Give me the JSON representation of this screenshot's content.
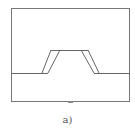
{
  "figure": {
    "caption": "a)",
    "stroke_color": "#666666",
    "background": "#ffffff"
  }
}
